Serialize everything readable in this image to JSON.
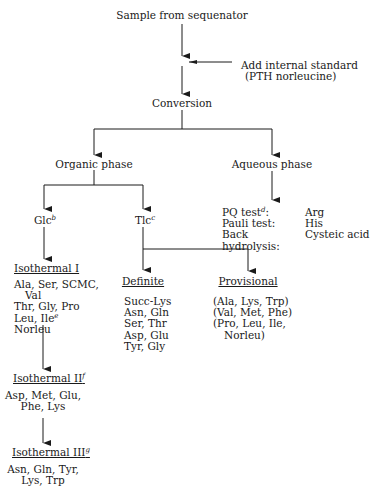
{
  "diagram": {
    "type": "flowchart",
    "nodes": {
      "start": "Sample from sequenator",
      "standard_line1": "Add internal standard",
      "standard_line2": "(PTH norleucine)",
      "conversion": "Conversion",
      "organic": "Organic phase",
      "aqueous": "Aqueous phase",
      "glc": "Glc",
      "glc_sup": "b",
      "tlc": "Tlc",
      "tlc_sup": "c",
      "iso1": "Isothermal I",
      "iso2": "Isothermal II",
      "iso2_sup": "f",
      "iso3": "Isothermal III",
      "iso3_sup": "g",
      "definite": "Definite",
      "provisional": "Provisional"
    },
    "aqueous_tests": [
      {
        "test": "PQ test",
        "sup": "d",
        "suffix": ":",
        "result": "Arg"
      },
      {
        "test": "Pauli test:",
        "sup": "",
        "suffix": "",
        "result": "His"
      },
      {
        "test": "Back hydrolysis:",
        "sup": "",
        "suffix": "",
        "result": "Cysteic acid"
      }
    ],
    "iso1_items": {
      "l1": "Ala, Ser, SCMC,",
      "l2": "Val",
      "l3": "Thr, Gly, Pro",
      "l4": "Leu, Ile",
      "l4_sup": "e",
      "l5": "Norleu"
    },
    "iso2_items": [
      "Asp, Met, Glu,",
      "Phe, Lys"
    ],
    "iso3_items": [
      "Asn, Gln, Tyr,",
      "Lys, Trp"
    ],
    "definite_items": [
      "Succ-Lys",
      "Asn, Gln",
      "Ser, Thr",
      "Asp, Glu",
      "Tyr, Gly"
    ],
    "provisional_items": [
      "(Ala, Lys, Trp)",
      "(Val, Met, Phe)",
      "(Pro, Leu, Ile,",
      "Norleu)"
    ]
  }
}
